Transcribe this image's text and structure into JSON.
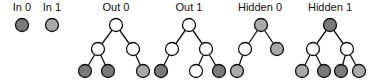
{
  "colors": {
    "white": "#ffffff",
    "dark": "#7a7a7a",
    "light": "#a9a9a9",
    "stroke": "#111111"
  },
  "node_radius": 6.5,
  "legend": [
    {
      "label": "In 0",
      "x": 22,
      "y": 25,
      "fill": "dark",
      "label_x": 22
    },
    {
      "label": "In 1",
      "x": 52,
      "y": 25,
      "fill": "light",
      "label_x": 52
    }
  ],
  "trees": [
    {
      "label": "Out 0",
      "label_x": 116,
      "nodes": [
        {
          "id": "r",
          "x": 116,
          "y": 25,
          "fill": "white"
        },
        {
          "id": "a",
          "x": 98,
          "y": 49,
          "fill": "white"
        },
        {
          "id": "b",
          "x": 133,
          "y": 49,
          "fill": "white"
        },
        {
          "id": "c",
          "x": 85,
          "y": 71,
          "fill": "dark"
        },
        {
          "id": "d",
          "x": 108,
          "y": 71,
          "fill": "dark"
        },
        {
          "id": "e",
          "x": 143,
          "y": 71,
          "fill": "light"
        }
      ],
      "edges": [
        [
          "r",
          "a"
        ],
        [
          "r",
          "b"
        ],
        [
          "a",
          "c"
        ],
        [
          "a",
          "d"
        ],
        [
          "b",
          "e"
        ]
      ]
    },
    {
      "label": "Out 1",
      "label_x": 189,
      "nodes": [
        {
          "id": "r",
          "x": 189,
          "y": 25,
          "fill": "white"
        },
        {
          "id": "a",
          "x": 172,
          "y": 49,
          "fill": "white"
        },
        {
          "id": "b",
          "x": 206,
          "y": 49,
          "fill": "white"
        },
        {
          "id": "c",
          "x": 161,
          "y": 71,
          "fill": "dark"
        },
        {
          "id": "d",
          "x": 196,
          "y": 71,
          "fill": "white"
        },
        {
          "id": "e",
          "x": 219,
          "y": 71,
          "fill": "dark"
        }
      ],
      "edges": [
        [
          "r",
          "a"
        ],
        [
          "r",
          "b"
        ],
        [
          "a",
          "c"
        ],
        [
          "b",
          "d"
        ],
        [
          "b",
          "e"
        ]
      ]
    },
    {
      "label": "Hidden 0",
      "label_x": 260,
      "nodes": [
        {
          "id": "r",
          "x": 261,
          "y": 25,
          "fill": "light"
        },
        {
          "id": "a",
          "x": 245,
          "y": 49,
          "fill": "white"
        },
        {
          "id": "b",
          "x": 277,
          "y": 49,
          "fill": "light"
        },
        {
          "id": "c",
          "x": 237,
          "y": 71,
          "fill": "light"
        }
      ],
      "edges": [
        [
          "r",
          "a"
        ],
        [
          "r",
          "b"
        ],
        [
          "a",
          "c"
        ]
      ]
    },
    {
      "label": "Hidden 1",
      "label_x": 330,
      "nodes": [
        {
          "id": "r",
          "x": 330,
          "y": 25,
          "fill": "dark"
        },
        {
          "id": "a",
          "x": 313,
          "y": 49,
          "fill": "white"
        },
        {
          "id": "b",
          "x": 347,
          "y": 49,
          "fill": "white"
        },
        {
          "id": "c",
          "x": 302,
          "y": 71,
          "fill": "light"
        },
        {
          "id": "d",
          "x": 324,
          "y": 71,
          "fill": "dark"
        },
        {
          "id": "e",
          "x": 341,
          "y": 71,
          "fill": "dark"
        },
        {
          "id": "f",
          "x": 359,
          "y": 71,
          "fill": "light"
        }
      ],
      "edges": [
        [
          "r",
          "a"
        ],
        [
          "r",
          "b"
        ],
        [
          "a",
          "c"
        ],
        [
          "a",
          "d"
        ],
        [
          "b",
          "e"
        ],
        [
          "b",
          "f"
        ]
      ]
    }
  ],
  "label_y": 11
}
